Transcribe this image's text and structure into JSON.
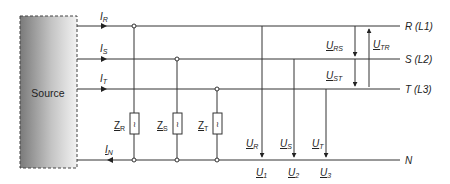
{
  "source": {
    "label": "Source"
  },
  "lines": [
    {
      "id": "R",
      "label": "R (L1)",
      "current": "I",
      "current_sub": "R"
    },
    {
      "id": "S",
      "label": "S (L2)",
      "current": "I",
      "current_sub": "S"
    },
    {
      "id": "T",
      "label": "T (L3)",
      "current": "I",
      "current_sub": "T"
    },
    {
      "id": "N",
      "label": "N",
      "current": "I",
      "current_sub": "N"
    }
  ],
  "impedances": [
    {
      "main": "Z",
      "sub": "R",
      "glyph": "≀"
    },
    {
      "main": "Z",
      "sub": "S",
      "glyph": "≀"
    },
    {
      "main": "Z",
      "sub": "T",
      "glyph": "≀"
    }
  ],
  "phase_voltages": [
    {
      "main": "U",
      "sub": "R",
      "node": "U",
      "node_sub": "1"
    },
    {
      "main": "U",
      "sub": "S",
      "node": "U",
      "node_sub": "2"
    },
    {
      "main": "U",
      "sub": "T",
      "node": "U",
      "node_sub": "3"
    }
  ],
  "line_voltages": [
    {
      "main": "U",
      "sub": "RS"
    },
    {
      "main": "U",
      "sub": "ST"
    },
    {
      "main": "U",
      "sub": "TR"
    }
  ]
}
